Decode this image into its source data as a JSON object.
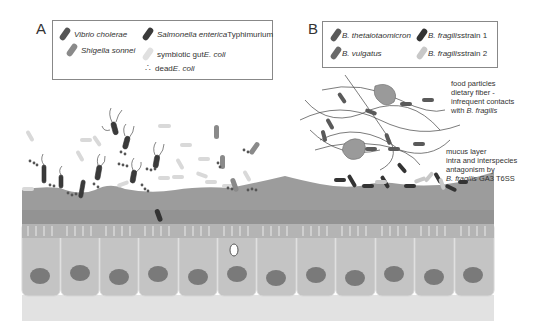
{
  "panels": {
    "a": {
      "label": "A",
      "legend": [
        {
          "name": "Vibrio cholerae",
          "italic": "Vibrio cholerae",
          "suffix": "",
          "color": "#555555"
        },
        {
          "name": "Salmonella enterica Typhimurium",
          "italic": "Salmonella enterica",
          "suffix": " Typhimurium",
          "color": "#3a3a3a"
        },
        {
          "name": "Shigella sonnei",
          "italic": "Shigella sonnei",
          "suffix": "",
          "color": "#8a8a8a"
        },
        {
          "name": "symbiotic gut E. coli",
          "prefix": "symbiotic gut ",
          "italic": "E. coli",
          "color": "#d8d8d8"
        },
        {
          "name": "dead E. coli",
          "prefix": "dead ",
          "italic": "E. coli",
          "color": "#555555"
        }
      ]
    },
    "b": {
      "label": "B",
      "legend": [
        {
          "name": "B. thetaiotaomicron",
          "italic": "B. thetaiotaomicron",
          "color": "#5a5a5a"
        },
        {
          "name": "B. fragilis strain 1",
          "italic": "B. fragilis",
          "suffix": " strain 1",
          "color": "#333333"
        },
        {
          "name": "B. vulgatus",
          "italic": "B. vulgatus",
          "color": "#6a6a6a"
        },
        {
          "name": "B. fragilis strain 2",
          "italic": "B. fragilis",
          "suffix": " strain 2",
          "color": "#c8c8c8"
        }
      ],
      "annotations": {
        "food": {
          "line1": "food particles",
          "line2": "dietary fiber -",
          "line3": "infrequent contacts",
          "line4_prefix": "with ",
          "line4_italic": "B. fragilis"
        },
        "mucus": {
          "line1": "mucus layer",
          "line2": "intra and interspecies",
          "line3": "antagonism by",
          "line4_italic": "B. fragilis",
          "line4_suffix": " GA3 T6SS"
        }
      }
    }
  },
  "colors": {
    "mucus": "#9c9c9c",
    "mucus_dark": "#8e8e8e",
    "cell": "#c4c4c4",
    "nucleus": "#7a7a7a",
    "basal": "#e2e2e2"
  }
}
